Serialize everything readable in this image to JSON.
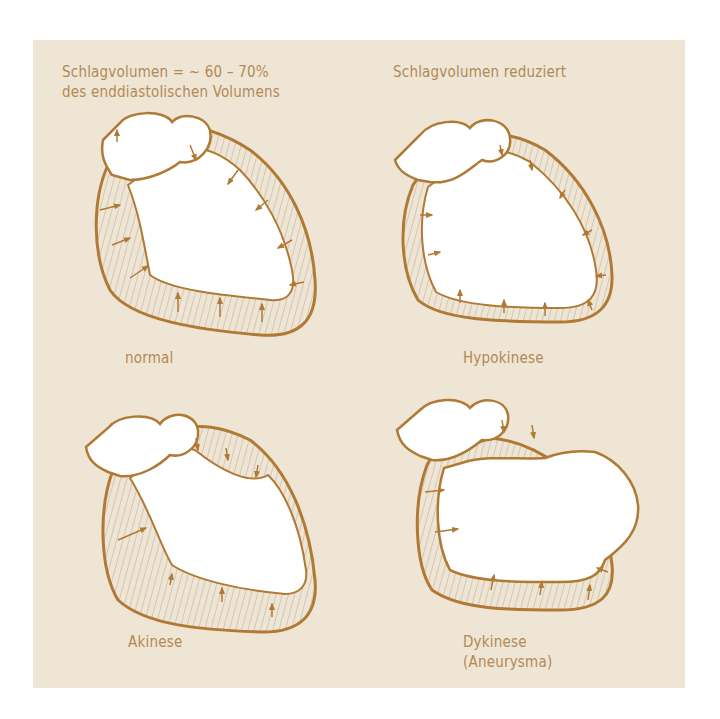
{
  "figure": {
    "top_left_caption": {
      "line1": "Schlagvolumen = ~ 60 – 70%",
      "line2": "des enddiastolischen Volumens"
    },
    "top_right_caption": "Schlagvolumen reduziert",
    "panels": [
      {
        "label": "normal"
      },
      {
        "label": "Hypokinese"
      },
      {
        "label": "Akinese"
      },
      {
        "label": "Dykinese",
        "label_line2": "(Aneurysma)"
      }
    ],
    "colors": {
      "background": "#efe5d4",
      "outline": "#b07a35",
      "text": "#b28a55",
      "hatch": "#a89a88",
      "chamber": "#ffffff"
    }
  }
}
